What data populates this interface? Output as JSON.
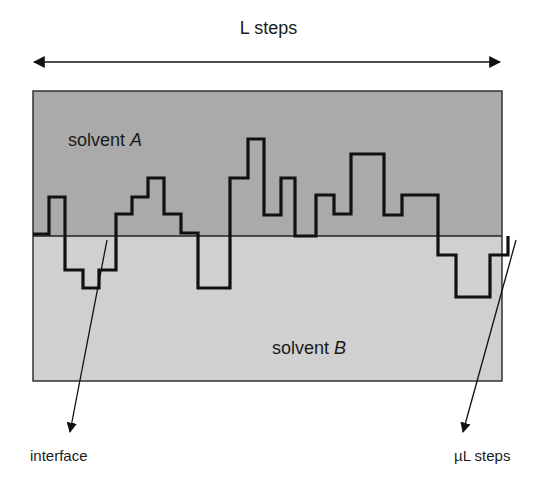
{
  "diagram": {
    "title": "L steps",
    "regions": {
      "top": {
        "label": "solvent",
        "letter": "A",
        "color": "#aaaaaa"
      },
      "bottom": {
        "label": "solvent",
        "letter": "B",
        "color": "#d0d0d0"
      }
    },
    "annotations": {
      "interface": "interface",
      "mu_l": "µL steps"
    },
    "colors": {
      "line": "#111111",
      "border": "#333333",
      "background": "#ffffff"
    }
  }
}
